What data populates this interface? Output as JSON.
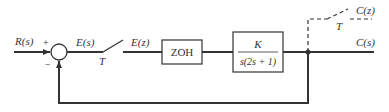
{
  "diagram": {
    "type": "sampled-data closed-loop block diagram",
    "colors": {
      "line": "#333333",
      "background": "#ffffff"
    },
    "signals": {
      "input": "R(s)",
      "error_continuous": "E(s)",
      "error_sampled": "E(z)",
      "output_continuous": "C(s)",
      "output_sampled": "C(z)"
    },
    "summing_junction": {
      "plus_sign": "+",
      "minus_sign": "−"
    },
    "samplers": [
      {
        "label": "T",
        "position": "error path"
      },
      {
        "label": "T",
        "position": "output path (dashed)"
      }
    ],
    "blocks": {
      "zoh": {
        "label": "ZOH"
      },
      "plant": {
        "numerator": "K",
        "denominator": "s(2s + 1)"
      }
    }
  }
}
